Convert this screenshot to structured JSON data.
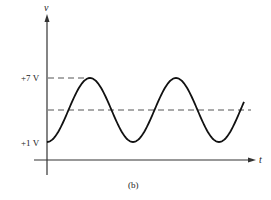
{
  "figure": {
    "caption": "(b)",
    "y_axis_label": "v",
    "x_axis_label": "t",
    "ticks": {
      "upper": "+7 V",
      "lower": "+1 V"
    },
    "colors": {
      "curve": "#111111",
      "axes": "#333333",
      "dashed": "#555555",
      "background": "#ffffff"
    }
  },
  "chart_data": {
    "type": "line",
    "title": "",
    "caption": "(b)",
    "xlabel": "t",
    "ylabel": "v",
    "y_tick_labels": [
      "+1 V",
      "+7 V"
    ],
    "y_ticks": [
      1,
      7
    ],
    "ylim": [
      0,
      8
    ],
    "grid": false,
    "legend": null,
    "series": [
      {
        "name": "v(t)",
        "dc_offset": 4,
        "amplitude": 3,
        "min": 1,
        "max": 7,
        "start_value": 1,
        "cycles_shown": 2.3,
        "points": [
          {
            "t": 0.0,
            "v": 1
          },
          {
            "t": 0.25,
            "v": 4
          },
          {
            "t": 0.5,
            "v": 7
          },
          {
            "t": 0.75,
            "v": 4
          },
          {
            "t": 1.0,
            "v": 1
          },
          {
            "t": 1.25,
            "v": 4
          },
          {
            "t": 1.5,
            "v": 7
          },
          {
            "t": 1.75,
            "v": 4
          },
          {
            "t": 2.0,
            "v": 1
          },
          {
            "t": 2.25,
            "v": 4
          },
          {
            "t": 2.3,
            "v": 4.9
          }
        ]
      }
    ],
    "reference_lines": [
      {
        "value": 7,
        "style": "dashed",
        "label": "+7 V"
      },
      {
        "value": 4,
        "style": "dashed",
        "label": "DC level"
      }
    ]
  }
}
